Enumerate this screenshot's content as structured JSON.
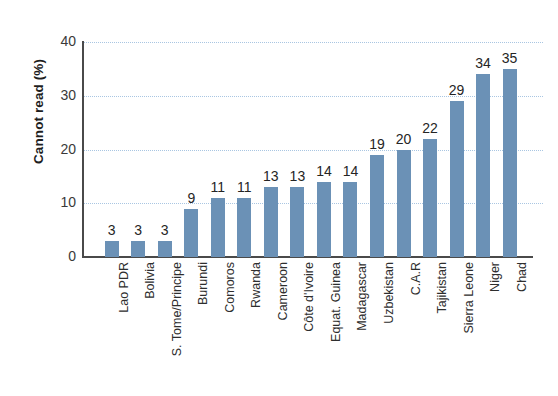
{
  "chart_data": {
    "type": "bar",
    "title": "",
    "subtitle": "",
    "xlabel": "",
    "ylabel": "Cannot read (%)",
    "ylim": [
      0,
      40
    ],
    "yticks": [
      0,
      10,
      20,
      30,
      40
    ],
    "ytick_labels": [
      "0",
      "10",
      "20",
      "30",
      "40"
    ],
    "grid": true,
    "grid_axis": "y",
    "grid_style": "dotted",
    "legend": false,
    "legend_position": "none",
    "bar_color": "#6b91b6",
    "axis_color": "#4a4a4a",
    "grid_color": "#a9c6e2",
    "value_labels_shown": true,
    "categories": [
      "Lao PDR",
      "Bolivia",
      "S. Tome/Principe",
      "Burundi",
      "Comoros",
      "Rwanda",
      "Cameroon",
      "Côte d'Ivoire",
      "Equat. Guinea",
      "Madagascar",
      "Uzbekistan",
      "C.A.R",
      "Tajikistan",
      "Sierra Leone",
      "Niger",
      "Chad"
    ],
    "values": [
      3,
      3,
      3,
      9,
      11,
      11,
      13,
      13,
      14,
      14,
      19,
      20,
      22,
      29,
      34,
      35
    ],
    "value_label_texts": [
      "3",
      "3",
      "3",
      "9",
      "11",
      "11",
      "13",
      "13",
      "14",
      "14",
      "19",
      "20",
      "22",
      "29",
      "34",
      "35"
    ]
  }
}
